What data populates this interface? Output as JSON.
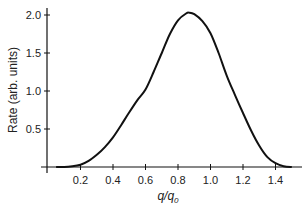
{
  "chart_data": {
    "type": "line",
    "title": "",
    "xlabel": "q/q0",
    "ylabel": "Rate (arb. units)",
    "xlim": [
      0,
      1.55
    ],
    "ylim": [
      0,
      2.1
    ],
    "xticks": [
      0.2,
      0.4,
      0.6,
      0.8,
      1.0,
      1.2,
      1.4
    ],
    "xtick_labels": [
      "0.2",
      "0.4",
      "0.6",
      "0.8",
      "1.0",
      "1.2",
      "1.4"
    ],
    "yticks": [
      0.5,
      1.0,
      1.5,
      2.0
    ],
    "ytick_labels": [
      "0.5",
      "1.0",
      "1.5",
      "2.0"
    ],
    "grid": false,
    "legend": null,
    "series": [
      {
        "name": "Rate",
        "color": "#111111",
        "x": [
          0.05,
          0.1,
          0.15,
          0.2,
          0.25,
          0.3,
          0.35,
          0.4,
          0.45,
          0.5,
          0.55,
          0.6,
          0.65,
          0.7,
          0.75,
          0.8,
          0.85,
          0.87,
          0.9,
          0.95,
          1.0,
          1.05,
          1.1,
          1.15,
          1.2,
          1.25,
          1.3,
          1.35,
          1.4,
          1.45,
          1.5
        ],
        "values": [
          0.0,
          0.0,
          0.01,
          0.03,
          0.08,
          0.16,
          0.26,
          0.39,
          0.55,
          0.72,
          0.88,
          1.02,
          1.25,
          1.5,
          1.75,
          1.93,
          2.02,
          2.03,
          2.01,
          1.92,
          1.76,
          1.5,
          1.2,
          0.95,
          0.71,
          0.48,
          0.28,
          0.13,
          0.05,
          0.01,
          0.0
        ]
      }
    ]
  },
  "labels": {
    "ylabel": "Rate (arb. units)",
    "xlabel_main": "q/q",
    "xlabel_sub": "0"
  }
}
